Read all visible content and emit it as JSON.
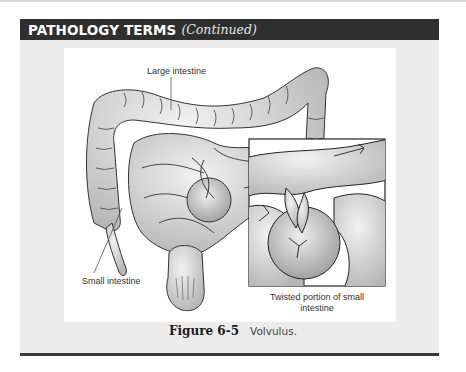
{
  "header": {
    "title": "PATHOLOGY TERMS",
    "subtitle": "(Continued)"
  },
  "figure": {
    "labels": {
      "large_intestine": "Large intestine",
      "small_intestine": "Small intestine",
      "inset_caption": "Twisted portion of small intestine"
    },
    "caption": {
      "number": "Figure 6-5",
      "text": "Volvulus."
    }
  },
  "colors": {
    "header_bg": "#2f2f2f",
    "panel_bg": "#ececec",
    "figure_bg": "#ffffff",
    "rule": "#3a3a3a"
  }
}
